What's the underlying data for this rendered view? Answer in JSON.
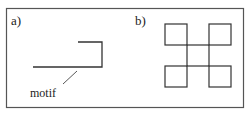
{
  "panels": {
    "a": {
      "label": "a)",
      "annotation": "motif"
    },
    "b": {
      "label": "b)"
    }
  },
  "colors": {
    "stroke": "#333333",
    "frame": "#555555",
    "background": "#ffffff"
  }
}
